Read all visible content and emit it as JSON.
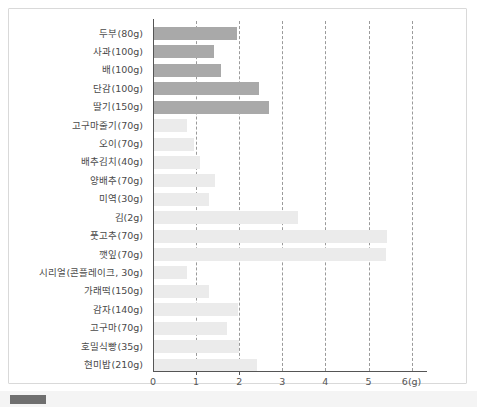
{
  "chart_data": {
    "type": "bar",
    "orientation": "horizontal",
    "title": "",
    "xlabel": "6(g)",
    "ylabel": "",
    "xlim": [
      0,
      6
    ],
    "grid": true,
    "gridlines": [
      1,
      2,
      3,
      4,
      5,
      6
    ],
    "xticks": [
      "0",
      "1",
      "2",
      "3",
      "4",
      "5",
      "6(g)"
    ],
    "xtick_values": [
      0,
      1,
      2,
      3,
      4,
      5,
      6
    ],
    "legend_position": "bottom",
    "categories": [
      "두부(80g)",
      "사과(100g)",
      "배(100g)",
      "단감(100g)",
      "딸기(150g)",
      "고구마줄기(70g)",
      "오이(70g)",
      "배추김치(40g)",
      "양배추(70g)",
      "미역(30g)",
      "김(2g)",
      "풋고추(70g)",
      "깻잎(70g)",
      "시리얼(콘플레이크, 30g)",
      "가래떡(150g)",
      "감자(140g)",
      "고구마(70g)",
      "호밀식빵(35g)",
      "현미밥(210g)"
    ],
    "values": [
      1.95,
      1.42,
      1.58,
      2.45,
      2.7,
      0.78,
      0.95,
      1.1,
      1.45,
      1.3,
      3.37,
      5.42,
      5.4,
      0.78,
      1.3,
      1.97,
      1.72,
      2.0,
      2.42
    ],
    "series": [
      {
        "name": "dark-group",
        "color": "#a9a9a9",
        "indices": [
          0,
          1,
          2,
          3,
          4
        ]
      },
      {
        "name": "light-group",
        "color": "#ebebeb",
        "indices": [
          5,
          6,
          7,
          8,
          9,
          10,
          11,
          12,
          13,
          14,
          15,
          16,
          17,
          18
        ]
      }
    ],
    "bar_colors": [
      "#a9a9a9",
      "#a9a9a9",
      "#a9a9a9",
      "#a9a9a9",
      "#a9a9a9",
      "#ebebeb",
      "#ebebeb",
      "#ebebeb",
      "#ebebeb",
      "#ebebeb",
      "#ebebeb",
      "#ebebeb",
      "#ebebeb",
      "#ebebeb",
      "#ebebeb",
      "#ebebeb",
      "#ebebeb",
      "#ebebeb",
      "#ebebeb"
    ]
  },
  "footer": {
    "legend_label": "",
    "swatch_color": "#6f6f6f"
  },
  "colors": {
    "card_border": "#d9d9d9",
    "axis": "#555555",
    "gridline": "#9a9a9a",
    "label_text": "#4a4a4a",
    "tick_text": "#555555",
    "background": "#ffffff",
    "footer_background": "#f4f4f4"
  }
}
